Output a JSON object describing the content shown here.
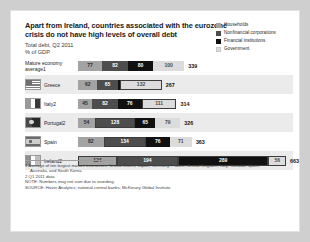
{
  "header": {
    "title": "Apart from Ireland, countries associated with the eurozone crisis do not have high levels of overall debt",
    "subtitle": "Total debt, Q2 2011",
    "units": "% of GDP"
  },
  "legend": {
    "items": [
      {
        "label": "Households",
        "color": "#a3a3a3",
        "icon": "legend-swatch-households"
      },
      {
        "label": "Nonfinancial corporations",
        "color": "#4d4d4d",
        "icon": "legend-swatch-nonfinancial"
      },
      {
        "label": "Financial institutions",
        "color": "#111111",
        "icon": "legend-swatch-financial"
      },
      {
        "label": "Government",
        "color": "#dcdcdc",
        "icon": "legend-swatch-government"
      }
    ]
  },
  "annotation": {
    "label": "Higher than mature economy average",
    "marker": "outlined-box"
  },
  "footnotes": {
    "note1": "1 Average of ten largest mature economies: United States, Japan, Germany, France, United Kingdom, Italy, Canada, Spain,",
    "note1b": "Australia, and South Korea.",
    "note2": "2 Q1 2011 data.",
    "note": "NOTE: Numbers may not sum due to rounding.",
    "source": "SOURCE: Haver Analytics; national central banks; McKinsey Global Institute"
  },
  "chart_data": {
    "type": "bar",
    "title": "Apart from Ireland, countries associated with the eurozone crisis do not have high levels of overall debt",
    "subtitle": "Total debt, Q2 2011",
    "ylabel": "% of GDP",
    "xlabel": "",
    "orientation": "horizontal",
    "stacked": true,
    "grid": false,
    "legend_position": "top-right",
    "categories": [
      "Mature economy average1",
      "Greece",
      "Italy2",
      "Portugal2",
      "Spain",
      "Ireland2"
    ],
    "series": [
      {
        "name": "Households",
        "color": "#a3a3a3",
        "values": [
          77,
          62,
          45,
          54,
          82,
          124
        ]
      },
      {
        "name": "Nonfinancial corporations",
        "color": "#4d4d4d",
        "values": [
          82,
          65,
          82,
          128,
          134,
          194
        ]
      },
      {
        "name": "Financial institutions",
        "color": "#111111",
        "values": [
          80,
          8,
          76,
          65,
          76,
          289
        ]
      },
      {
        "name": "Government",
        "color": "#dcdcdc",
        "values": [
          100,
          132,
          111,
          79,
          71,
          56
        ]
      }
    ],
    "totals": [
      339,
      267,
      314,
      326,
      363,
      663
    ],
    "highlighted": {
      "Greece": [
        "Government"
      ],
      "Italy2": [
        "Government"
      ],
      "Portugal2": [
        "Nonfinancial corporations"
      ],
      "Spain": [
        "Nonfinancial corporations"
      ],
      "Ireland2": [
        "Households",
        "Nonfinancial corporations",
        "Financial institutions",
        "Government"
      ]
    },
    "rows": [
      {
        "label": "Mature economy",
        "label2": "average1",
        "flag": "none",
        "band": "white",
        "total": 339,
        "segments": [
          {
            "series": "Households",
            "value": 77,
            "hi": false
          },
          {
            "series": "Nonfinancial corporations",
            "value": 82,
            "hi": false
          },
          {
            "series": "Financial institutions",
            "value": 80,
            "hi": false
          },
          {
            "series": "Government",
            "value": 100,
            "hi": false
          }
        ]
      },
      {
        "label": "Greece",
        "label2": "",
        "flag": "flag-greece",
        "band": "grey",
        "total": 267,
        "segments": [
          {
            "series": "Households",
            "value": 62,
            "hi": false
          },
          {
            "series": "Nonfinancial corporations",
            "value": 65,
            "hi": false
          },
          {
            "series": "Financial institutions",
            "value": 8,
            "hi": false
          },
          {
            "series": "Government",
            "value": 132,
            "hi": true
          }
        ]
      },
      {
        "label": "Italy2",
        "label2": "",
        "flag": "flag-italy",
        "band": "white",
        "total": 314,
        "segments": [
          {
            "series": "Households",
            "value": 45,
            "hi": false
          },
          {
            "series": "Nonfinancial corporations",
            "value": 82,
            "hi": false
          },
          {
            "series": "Financial institutions",
            "value": 76,
            "hi": false
          },
          {
            "series": "Government",
            "value": 111,
            "hi": true
          }
        ]
      },
      {
        "label": "Portugal2",
        "label2": "",
        "flag": "flag-portugal",
        "band": "grey",
        "total": 326,
        "segments": [
          {
            "series": "Households",
            "value": 54,
            "hi": false
          },
          {
            "series": "Nonfinancial corporations",
            "value": 128,
            "hi": true
          },
          {
            "series": "Financial institutions",
            "value": 65,
            "hi": false
          },
          {
            "series": "Government",
            "value": 79,
            "hi": false
          }
        ]
      },
      {
        "label": "Spain",
        "label2": "",
        "flag": "flag-spain",
        "band": "white",
        "total": 363,
        "segments": [
          {
            "series": "Households",
            "value": 82,
            "hi": false
          },
          {
            "series": "Nonfinancial corporations",
            "value": 134,
            "hi": true
          },
          {
            "series": "Financial institutions",
            "value": 76,
            "hi": false
          },
          {
            "series": "Government",
            "value": 71,
            "hi": false
          }
        ]
      },
      {
        "label": "Ireland2",
        "label2": "",
        "flag": "flag-ireland",
        "band": "grey",
        "total": 663,
        "segments": [
          {
            "series": "Households",
            "value": 124,
            "hi": true
          },
          {
            "series": "Nonfinancial corporations",
            "value": 194,
            "hi": true
          },
          {
            "series": "Financial institutions",
            "value": 289,
            "hi": true
          },
          {
            "series": "Government",
            "value": 56,
            "hi": true
          }
        ]
      }
    ]
  }
}
